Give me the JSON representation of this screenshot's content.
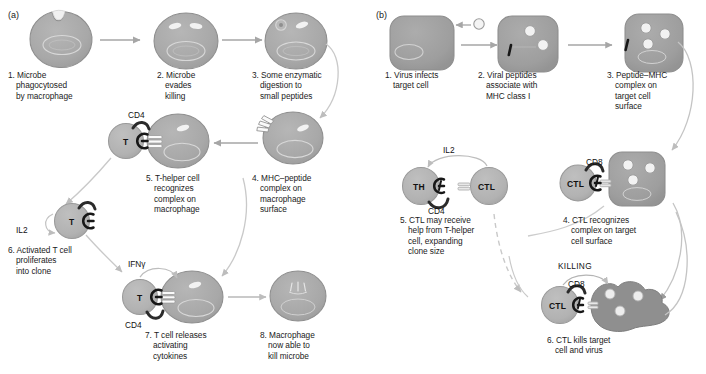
{
  "figure": {
    "background": "#ffffff",
    "colors": {
      "cell_fill": "#a9a9a9",
      "cell_stroke": "#8a8a8a",
      "tcell_fill": "#b4b4b4",
      "target_fill": "#9f9f9f",
      "dying_cell_fill": "#8c8c8c",
      "arrow_gray": "#a6a6a6",
      "receptor_black": "#171717",
      "text": "#1b1b1b",
      "white_feature": "#f2f2f2"
    }
  },
  "panel_a": {
    "label": "(a)",
    "steps": [
      {
        "id": "a1",
        "number": "1.",
        "text": "1. Microbe\nphagocytosed\nby macrophage"
      },
      {
        "id": "a2",
        "number": "2.",
        "text": "2. Microbe\nevades\nkilling"
      },
      {
        "id": "a3",
        "number": "3.",
        "text": "3. Some enzymatic\ndigestion to\nsmall peptides"
      },
      {
        "id": "a4",
        "number": "4.",
        "text": "4. MHC–peptide\ncomplex on\nmacrophage\nsurface"
      },
      {
        "id": "a5",
        "number": "5.",
        "text": "5. T-helper cell\nrecognizes\ncomplex on\nmacrophage"
      },
      {
        "id": "a6",
        "number": "6.",
        "text": "6. Activated T cell\nproliferates\ninto clone"
      },
      {
        "id": "a7",
        "number": "7.",
        "text": "7. T cell releases\nactivating\ncytokines"
      },
      {
        "id": "a8",
        "number": "8.",
        "text": "8. Macrophage\nnow able to\nkill microbe"
      }
    ],
    "molecules": [
      {
        "id": "cd4-top",
        "label": "CD4"
      },
      {
        "id": "il2",
        "label": "IL2"
      },
      {
        "id": "ifng",
        "label": "IFNγ"
      },
      {
        "id": "cd4-bottom",
        "label": "CD4"
      }
    ],
    "cell_labels": [
      {
        "id": "t-cell-6",
        "label": "T"
      },
      {
        "id": "t-cell-5",
        "label": "T"
      },
      {
        "id": "t-cell-7",
        "label": "T"
      }
    ]
  },
  "panel_b": {
    "label": "(b)",
    "steps": [
      {
        "id": "b1",
        "number": "1.",
        "text": "1. Virus infects\ntarget cell"
      },
      {
        "id": "b2",
        "number": "2.",
        "text": "2. Viral peptides\nassociate with\nMHC class I"
      },
      {
        "id": "b3",
        "number": "3.",
        "text": "3. Peptide–MHC\ncomplex on\ntarget cell\nsurface"
      },
      {
        "id": "b4",
        "number": "4.",
        "text": "4. CTL recognizes\ncomplex on target\ncell surface"
      },
      {
        "id": "b5",
        "number": "5.",
        "text": "5. CTL may receive\nhelp from T-helper\ncell, expanding\nclone size"
      },
      {
        "id": "b6",
        "number": "6.",
        "text": "6. CTL kills target\ncell and virus"
      }
    ],
    "molecules": [
      {
        "id": "il2-b",
        "label": "IL2"
      },
      {
        "id": "cd4-b",
        "label": "CD4"
      },
      {
        "id": "cd8-b4",
        "label": "CD8"
      },
      {
        "id": "cd8-b6",
        "label": "CD8"
      },
      {
        "id": "killing",
        "label": "KILLING"
      }
    ],
    "cell_labels": [
      {
        "id": "th-cell",
        "label": "TH"
      },
      {
        "id": "ctl-cell-5",
        "label": "CTL"
      },
      {
        "id": "ctl-cell-4",
        "label": "CTL"
      },
      {
        "id": "ctl-cell-6",
        "label": "CTL"
      }
    ]
  }
}
